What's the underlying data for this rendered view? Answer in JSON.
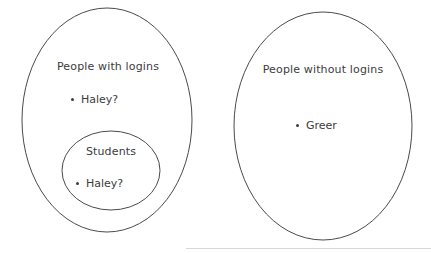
{
  "diagram": {
    "type": "venn-set-diagram",
    "colors": {
      "stroke": "#4a4a4a",
      "text": "#3c3c3c",
      "background": "#ffffff",
      "divider": "#d8d8dc"
    },
    "sets": [
      {
        "id": "people-with-logins",
        "title": "People with logins",
        "members": [
          "Haley?"
        ],
        "contains": "students"
      },
      {
        "id": "students",
        "title": "Students",
        "members": [
          "Haley?"
        ],
        "nested_in": "people-with-logins"
      },
      {
        "id": "people-without-logins",
        "title": "People without logins",
        "members": [
          "Greer"
        ]
      }
    ]
  }
}
